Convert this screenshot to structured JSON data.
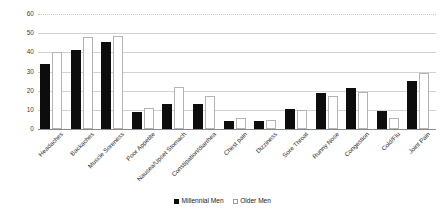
{
  "chart_data": {
    "type": "bar",
    "title": "",
    "subtitle": "",
    "xlabel": "",
    "ylabel": "",
    "ylim": [
      0,
      60
    ],
    "yticks": [
      0,
      10,
      20,
      30,
      40,
      50,
      60
    ],
    "ytick_labels": [
      "0",
      "10",
      "20",
      "30",
      "40",
      "50",
      "60"
    ],
    "grid": true,
    "legend_position": "bottom",
    "categories": [
      "Headaches",
      "Backaches",
      "Muscle Soreness",
      "Poor Appetite",
      "Nausea/Upset Stomach",
      "Constipation/diarrhea",
      "Chest pain",
      "Dizziness",
      "Sore Throat",
      "Runny Nose",
      "Congestion",
      "Cold/Flu",
      "Joint Pain"
    ],
    "series": [
      {
        "name": "Millennial Men",
        "color": "#0d0d0d",
        "values": [
          34,
          41,
          45.5,
          9,
          13,
          13,
          4,
          4,
          10.5,
          19,
          21.5,
          9.5,
          25
        ]
      },
      {
        "name": "Older Men",
        "color": "#ffffff",
        "values": [
          40,
          48,
          48.5,
          11,
          22,
          17,
          6,
          4.5,
          10,
          17,
          19.5,
          6,
          29
        ]
      }
    ]
  },
  "legend": {
    "items": [
      {
        "label": "Millennial Men",
        "marker": "filled-square-icon"
      },
      {
        "label": "Older Men",
        "marker": "outlined-square-icon"
      }
    ]
  },
  "colors": {
    "millennial": "#0d0d0d",
    "older": "#ffffff",
    "older_border": "#b4b4b4",
    "gridline": "#d2d2d2",
    "baseline": "#8a8a8a",
    "background": "#ffffff",
    "text": "#2b2b2b"
  }
}
